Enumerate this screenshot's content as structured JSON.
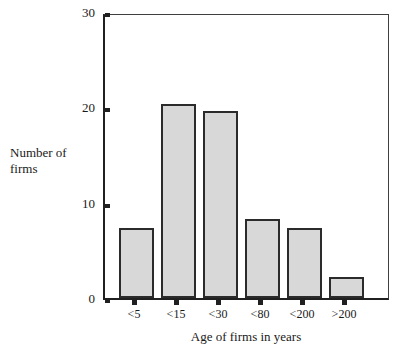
{
  "chart_data": {
    "type": "bar",
    "title": "",
    "subtitle": "",
    "xlabel": "Age of firms in years",
    "ylabel": "Number of\nfirms",
    "categories": [
      "<5",
      "<15",
      "<30",
      "<80",
      "<200",
      ">200"
    ],
    "values": [
      7.3,
      20.4,
      19.6,
      8.3,
      7.3,
      2.2
    ],
    "series": [
      {
        "name": "Number of firms",
        "values": [
          7.3,
          20.4,
          19.6,
          8.3,
          7.3,
          2.2
        ]
      }
    ],
    "ylim": [
      0,
      30
    ],
    "yticks": [
      0,
      10,
      20,
      30
    ],
    "ytick_labels": [
      "0",
      "10",
      "20",
      "30"
    ],
    "grid": false,
    "legend": false,
    "legend_position": "none",
    "bar_fill_color": "#d8d8d8",
    "bar_edge_color": "#2b2b2b",
    "axis_color": "#202020",
    "background_color": "#ffffff"
  }
}
